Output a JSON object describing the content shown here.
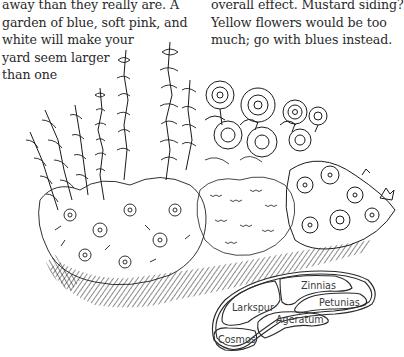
{
  "page": {
    "left_column": {
      "lines": [
        "away than they really are. A",
        "garden of blue, soft pink, and",
        "white will make your",
        "yard seem larger",
        "than one"
      ]
    },
    "right_column": {
      "lines": [
        "overall effect. Mustard siding?",
        "Yellow flowers would be too",
        "much; go with blues instead."
      ]
    }
  },
  "illustration": {
    "subject": "flower-garden-bed-drawing",
    "style": "black-ink-line-drawing",
    "ink_color": "#1a1a1a"
  },
  "bed_plan": {
    "sections": [
      {
        "name": "Zinnias"
      },
      {
        "name": "Larkspur"
      },
      {
        "name": "Petunias"
      },
      {
        "name": "Ageratum"
      },
      {
        "name": "Cosmos"
      }
    ]
  }
}
